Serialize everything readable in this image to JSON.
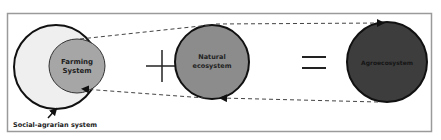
{
  "diagram": {
    "nodes": {
      "farming_system": {
        "line1": "Farming",
        "line2": "System",
        "fill": "#a6a6a6"
      },
      "social_agrarian": {
        "label": "Social-agrarian system",
        "fill": "#efefef"
      },
      "natural_ecosystem": {
        "line1": "Natural",
        "line2": "ecosystem",
        "fill": "#8c8c8c"
      },
      "agroecosystem": {
        "label": "Agroecosystem",
        "fill": "#3d3d3d"
      }
    },
    "operators": {
      "plus": "+",
      "equals": "="
    },
    "colors": {
      "stroke": "#111111",
      "frame": "#9a9a9a",
      "dash": "#444444"
    }
  }
}
